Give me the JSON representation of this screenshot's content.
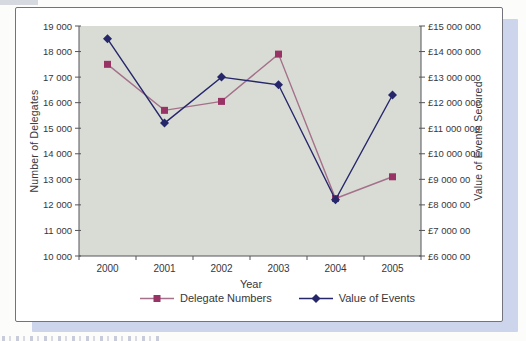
{
  "style": {
    "page_bg": "#fcfcfb",
    "box_border": "#73737d",
    "shadow_color": "#ccd5eb",
    "plot_bg": "#d9dcd5",
    "axis_color": "#55555a",
    "text_color": "#37373a"
  },
  "chart_data": {
    "type": "line",
    "title": "",
    "categories": [
      "2000",
      "2001",
      "2002",
      "2003",
      "2004",
      "2005"
    ],
    "series": [
      {
        "name": "Delegate Numbers",
        "axis": "left",
        "marker": "square",
        "marker_color": "#993366",
        "line_color": "#a4708a",
        "values": [
          17500,
          15700,
          16050,
          17900,
          12250,
          13100
        ]
      },
      {
        "name": "Value of Events",
        "axis": "right",
        "marker": "diamond",
        "marker_color": "#26266b",
        "line_color": "#26266b",
        "values": [
          14500000,
          11200000,
          13000000,
          12700000,
          8200000,
          12300000
        ]
      }
    ],
    "xlabel": "Year",
    "left_axis": {
      "label": "Number of Delegates",
      "min": 10000,
      "max": 19000,
      "tick_step": 1000,
      "tick_labels_top_to_bottom": [
        "19 000",
        "18 000",
        "17 000",
        "16 000",
        "15 000",
        "14 000",
        "13 000",
        "12 000",
        "11 000",
        "10 000"
      ]
    },
    "right_axis": {
      "label": "Value of Events Secured",
      "min": 6000000,
      "max": 15000000,
      "tick_step": 1000000,
      "tick_labels_top_to_bottom": [
        "£15 000 000",
        "£14 000 000",
        "£13 000 000",
        "£12 000 000",
        "£11 000 000",
        "£10 000 000",
        "£9 000 00",
        "£8 000 00",
        "£7 000 00",
        "£6 000 00"
      ]
    },
    "legend_position": "bottom",
    "grid": false
  }
}
